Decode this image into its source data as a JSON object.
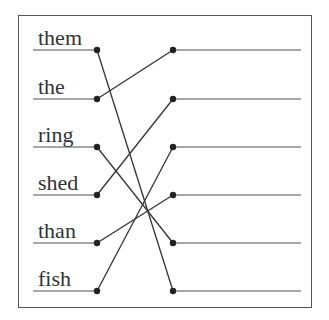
{
  "diagram": {
    "type": "matching-exercise",
    "left_words": [
      "them",
      "the",
      "ring",
      "shed",
      "than",
      "fish"
    ],
    "row_y": [
      50,
      99,
      147,
      195,
      243,
      291
    ],
    "left_line": {
      "x1": 33,
      "x2": 97
    },
    "right_line": {
      "x1": 173,
      "x2": 301
    },
    "connections": [
      {
        "from_left": 0,
        "to_right": 5
      },
      {
        "from_left": 1,
        "to_right": 0
      },
      {
        "from_left": 2,
        "to_right": 4
      },
      {
        "from_left": 3,
        "to_right": 1
      },
      {
        "from_left": 4,
        "to_right": 3
      },
      {
        "from_left": 5,
        "to_right": 2
      }
    ],
    "colors": {
      "line": "#888888",
      "connector": "#333333",
      "dot": "#222222",
      "frame": "#555555",
      "text": "#333333"
    }
  }
}
